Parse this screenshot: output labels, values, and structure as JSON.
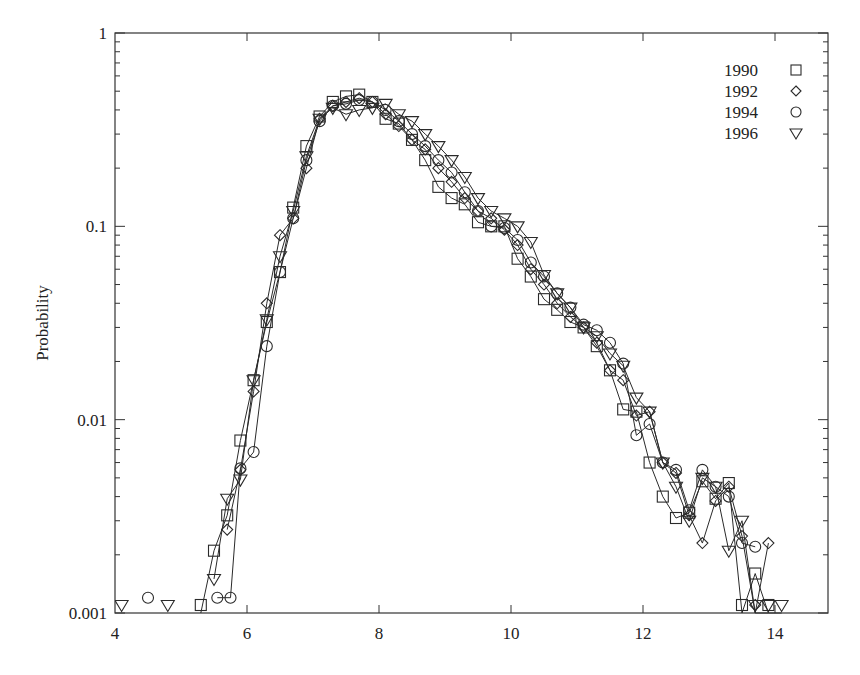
{
  "chart_data": {
    "type": "line",
    "title": "",
    "xlabel": "",
    "ylabel": "Probability",
    "yscale": "log",
    "xlim": [
      4,
      15
    ],
    "ylim": [
      0.001,
      1
    ],
    "xticks": [
      4,
      6,
      8,
      10,
      12,
      14
    ],
    "xtick_labels": [
      "4",
      "6",
      "8",
      "10",
      "12",
      "14"
    ],
    "yticks": [
      0.001,
      0.01,
      0.1,
      1
    ],
    "ytick_labels": [
      "0.001",
      "0.01",
      "0.1",
      "1"
    ],
    "grid": false,
    "legend_position": "upper right",
    "series": [
      {
        "name": "1990",
        "marker": "square",
        "x": [
          5.3,
          5.5,
          5.7,
          5.9,
          6.1,
          6.3,
          6.5,
          6.7,
          6.9,
          7.1,
          7.3,
          7.5,
          7.7,
          7.9,
          8.1,
          8.3,
          8.5,
          8.7,
          8.9,
          9.1,
          9.3,
          9.5,
          9.7,
          9.9,
          10.1,
          10.3,
          10.5,
          10.7,
          10.9,
          11.1,
          11.3,
          11.5,
          11.7,
          11.9,
          12.1,
          12.3,
          12.5,
          12.7,
          12.9,
          13.1,
          13.3,
          13.5,
          13.7,
          13.9
        ],
        "y": [
          0.0011,
          0.0021,
          0.0032,
          0.0078,
          0.016,
          0.032,
          0.058,
          0.125,
          0.26,
          0.37,
          0.44,
          0.47,
          0.48,
          0.44,
          0.36,
          0.34,
          0.28,
          0.22,
          0.16,
          0.14,
          0.13,
          0.105,
          0.1,
          0.1,
          0.068,
          0.055,
          0.042,
          0.037,
          0.032,
          0.03,
          0.024,
          0.018,
          0.0113,
          0.011,
          0.006,
          0.004,
          0.0031,
          0.0033,
          0.0048,
          0.0039,
          0.0047,
          0.001,
          0.0016,
          0.001
        ]
      },
      {
        "name": "1992",
        "marker": "diamond",
        "x": [
          5.7,
          5.9,
          6.1,
          6.3,
          6.5,
          6.7,
          6.9,
          7.1,
          7.3,
          7.5,
          7.7,
          7.9,
          8.1,
          8.3,
          8.5,
          8.7,
          8.9,
          9.1,
          9.3,
          9.5,
          9.7,
          9.9,
          10.1,
          10.3,
          10.5,
          10.7,
          10.9,
          11.1,
          11.3,
          11.5,
          11.7,
          11.9,
          12.1,
          12.3,
          12.5,
          12.7,
          12.9,
          13.1,
          13.3,
          13.5,
          13.7,
          13.9
        ],
        "y": [
          0.0027,
          0.0055,
          0.014,
          0.04,
          0.09,
          0.11,
          0.2,
          0.36,
          0.42,
          0.44,
          0.46,
          0.44,
          0.38,
          0.33,
          0.28,
          0.25,
          0.2,
          0.17,
          0.14,
          0.12,
          0.11,
          0.096,
          0.08,
          0.06,
          0.05,
          0.04,
          0.034,
          0.03,
          0.025,
          0.018,
          0.016,
          0.0105,
          0.011,
          0.006,
          0.0053,
          0.0032,
          0.0023,
          0.0038,
          0.0045,
          0.0025,
          0.001,
          0.0023
        ]
      },
      {
        "name": "1994",
        "marker": "circle",
        "x": [
          4.5,
          5.55,
          5.75,
          5.9,
          6.1,
          6.3,
          6.5,
          6.7,
          6.9,
          7.1,
          7.3,
          7.5,
          7.7,
          7.9,
          8.1,
          8.3,
          8.5,
          8.7,
          8.9,
          9.1,
          9.3,
          9.5,
          9.7,
          9.9,
          10.1,
          10.3,
          10.5,
          10.7,
          10.9,
          11.1,
          11.3,
          11.5,
          11.7,
          11.9,
          12.1,
          12.3,
          12.5,
          12.7,
          12.9,
          13.1,
          13.3,
          13.5,
          13.7
        ],
        "y": [
          0.0012,
          0.0012,
          0.0012,
          0.0056,
          0.0068,
          0.024,
          0.058,
          0.11,
          0.22,
          0.35,
          0.42,
          0.43,
          0.45,
          0.44,
          0.4,
          0.35,
          0.3,
          0.26,
          0.22,
          0.19,
          0.15,
          0.12,
          0.1,
          0.098,
          0.085,
          0.065,
          0.055,
          0.045,
          0.038,
          0.031,
          0.029,
          0.025,
          0.0195,
          0.0083,
          0.0095,
          0.006,
          0.0055,
          0.0034,
          0.0055,
          0.0045,
          0.004,
          0.0023,
          0.0022
        ]
      },
      {
        "name": "1996",
        "marker": "triangle-down",
        "x": [
          4.1,
          4.8,
          5.5,
          5.7,
          5.9,
          6.1,
          6.3,
          6.5,
          6.7,
          6.9,
          7.1,
          7.3,
          7.5,
          7.7,
          7.9,
          8.1,
          8.3,
          8.5,
          8.7,
          8.9,
          9.1,
          9.3,
          9.5,
          9.7,
          9.9,
          10.1,
          10.3,
          10.5,
          10.7,
          10.9,
          11.1,
          11.3,
          11.5,
          11.7,
          11.9,
          12.1,
          12.3,
          12.5,
          12.7,
          12.9,
          13.1,
          13.3,
          13.5,
          13.7,
          13.9,
          14.1
        ],
        "y": [
          0.0011,
          0.0011,
          0.0015,
          0.0039,
          0.0049,
          0.016,
          0.033,
          0.07,
          0.12,
          0.23,
          0.36,
          0.41,
          0.38,
          0.4,
          0.41,
          0.43,
          0.38,
          0.35,
          0.3,
          0.26,
          0.22,
          0.18,
          0.14,
          0.12,
          0.11,
          0.1,
          0.083,
          0.056,
          0.045,
          0.038,
          0.03,
          0.027,
          0.022,
          0.019,
          0.013,
          0.011,
          0.006,
          0.0045,
          0.003,
          0.005,
          0.0045,
          0.0021,
          0.003,
          0.001,
          0.001,
          0.001
        ]
      }
    ]
  },
  "legend": {
    "entries": [
      {
        "label": "1990",
        "marker": "square"
      },
      {
        "label": "1992",
        "marker": "diamond"
      },
      {
        "label": "1994",
        "marker": "circle"
      },
      {
        "label": "1996",
        "marker": "triangle-down"
      }
    ]
  },
  "axes": {
    "ylabel": "Probability"
  },
  "colors": {
    "line": "#2a2a2a",
    "axis": "#333333",
    "background": "#ffffff"
  }
}
